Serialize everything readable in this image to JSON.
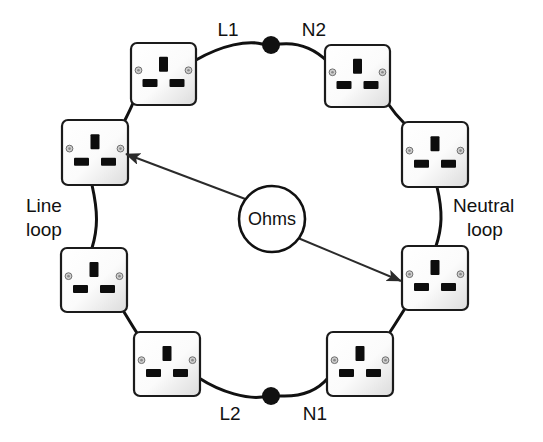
{
  "diagram": {
    "center_node": {
      "label": "Ohms",
      "name": "ohms-meter",
      "cx": 272,
      "cy": 219,
      "r": 33
    },
    "conductor_labels": [
      {
        "id": "l1",
        "text": "L1",
        "x": 228,
        "y": 31
      },
      {
        "id": "n2",
        "text": "N2",
        "x": 314,
        "y": 31
      },
      {
        "id": "l2",
        "text": "L2",
        "x": 230,
        "y": 415
      },
      {
        "id": "n1",
        "text": "N1",
        "x": 315,
        "y": 415
      }
    ],
    "loop_labels": [
      {
        "id": "line-loop",
        "line1": "Line",
        "line2": "loop",
        "x": 26,
        "y": 207,
        "anchor": "start"
      },
      {
        "id": "neutral-loop",
        "line1": "Neutral",
        "line2": "loop",
        "x": 453,
        "y": 207,
        "anchor": "start"
      }
    ],
    "junction_dots": [
      {
        "id": "top-break",
        "cx": 271,
        "cy": 45,
        "r": 9
      },
      {
        "id": "bottom-break",
        "cx": 271,
        "cy": 396,
        "r": 9
      }
    ],
    "sockets": [
      {
        "id": "socket-top-left",
        "x": 131,
        "y": 43,
        "w": 65,
        "h": 62
      },
      {
        "id": "socket-top-right",
        "x": 325,
        "y": 45,
        "w": 65,
        "h": 62
      },
      {
        "id": "socket-upper-left",
        "x": 62,
        "y": 120,
        "w": 66,
        "h": 65
      },
      {
        "id": "socket-upper-right",
        "x": 402,
        "y": 122,
        "w": 66,
        "h": 65
      },
      {
        "id": "socket-lower-left",
        "x": 61,
        "y": 248,
        "w": 66,
        "h": 64
      },
      {
        "id": "socket-lower-right",
        "x": 402,
        "y": 246,
        "w": 66,
        "h": 64
      },
      {
        "id": "socket-bottom-left",
        "x": 134,
        "y": 332,
        "w": 66,
        "h": 64
      },
      {
        "id": "socket-bottom-right",
        "x": 327,
        "y": 332,
        "w": 66,
        "h": 64
      }
    ],
    "wires": [
      {
        "id": "wire-top-left-to-dot",
        "d": "M 196 60 C 222 45 248 40 262 44"
      },
      {
        "id": "wire-dot-to-top-right",
        "d": "M 280 44 C 300 42 316 50 328 62"
      },
      {
        "id": "wire-topleft-to-upperleft",
        "d": "M 133 103 C 131 108 128 114 125 120"
      },
      {
        "id": "wire-topright-to-upperright",
        "d": "M 389 105 C 393 111 398 117 404 123"
      },
      {
        "id": "wire-upperleft-line-loop",
        "d": "M 92 185 C 98 212 98 228 92 248"
      },
      {
        "id": "wire-upperright-neutral",
        "d": "M 437 187 C 443 212 442 228 436 246"
      },
      {
        "id": "wire-lowerleft-to-bottom",
        "d": "M 124 312 C 129 320 133 327 137 333"
      },
      {
        "id": "wire-lowerright-to-bottom",
        "d": "M 404 310 C 399 318 394 326 390 332"
      },
      {
        "id": "wire-bottomleft-to-dot",
        "d": "M 199 378 C 222 393 248 399 262 397"
      },
      {
        "id": "wire-dot-to-bottomright",
        "d": "M 280 396 C 300 397 317 391 328 378"
      }
    ],
    "pointers": [
      {
        "id": "pointer-to-line-loop",
        "from_x": 248,
        "from_y": 200,
        "to_x": 126,
        "to_y": 154
      },
      {
        "id": "pointer-to-neutral-loop",
        "from_x": 298,
        "from_y": 238,
        "to_x": 401,
        "to_y": 281
      }
    ]
  }
}
